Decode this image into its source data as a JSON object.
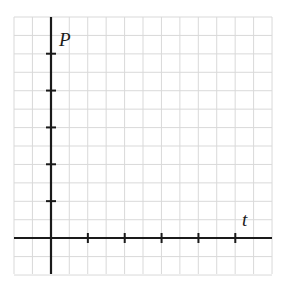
{
  "chart_data": {
    "type": "line",
    "title": "",
    "xlabel": "t",
    "ylabel": "P",
    "x_ticks": [
      1,
      2,
      3,
      4,
      5
    ],
    "y_ticks": [
      1,
      2,
      3,
      4,
      5
    ],
    "tick_labels_shown": false,
    "grid": true,
    "series": [],
    "xlim": [
      -1,
      5.5
    ],
    "ylim": [
      -1,
      5.5
    ]
  },
  "axes": {
    "x_label": "t",
    "y_label": "P"
  },
  "colors": {
    "grid": "#d9d9d9",
    "axis": "#1a1a1a",
    "background": "#ffffff"
  }
}
